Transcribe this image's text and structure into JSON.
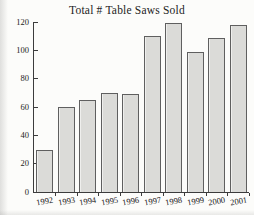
{
  "page": {
    "background": "#fcfcfa",
    "text_color": "#232323",
    "axis_color": "#3c3c3c"
  },
  "chart_data": {
    "type": "bar",
    "title": "Total # Table Saws Sold",
    "categories": [
      "1992",
      "1993",
      "1994",
      "1995",
      "1996",
      "1997",
      "1998",
      "1999",
      "2000",
      "2001"
    ],
    "values": [
      30,
      60,
      65,
      70,
      69,
      110,
      119,
      99,
      109,
      118
    ],
    "xlabel": "",
    "ylabel": "",
    "ylim": [
      0,
      120
    ],
    "yticks": [
      0,
      20,
      40,
      60,
      80,
      100,
      120
    ],
    "grid": false,
    "legend_position": "none",
    "bar_fill": "#dbdbd8",
    "bar_border": "#5f5f5f"
  }
}
